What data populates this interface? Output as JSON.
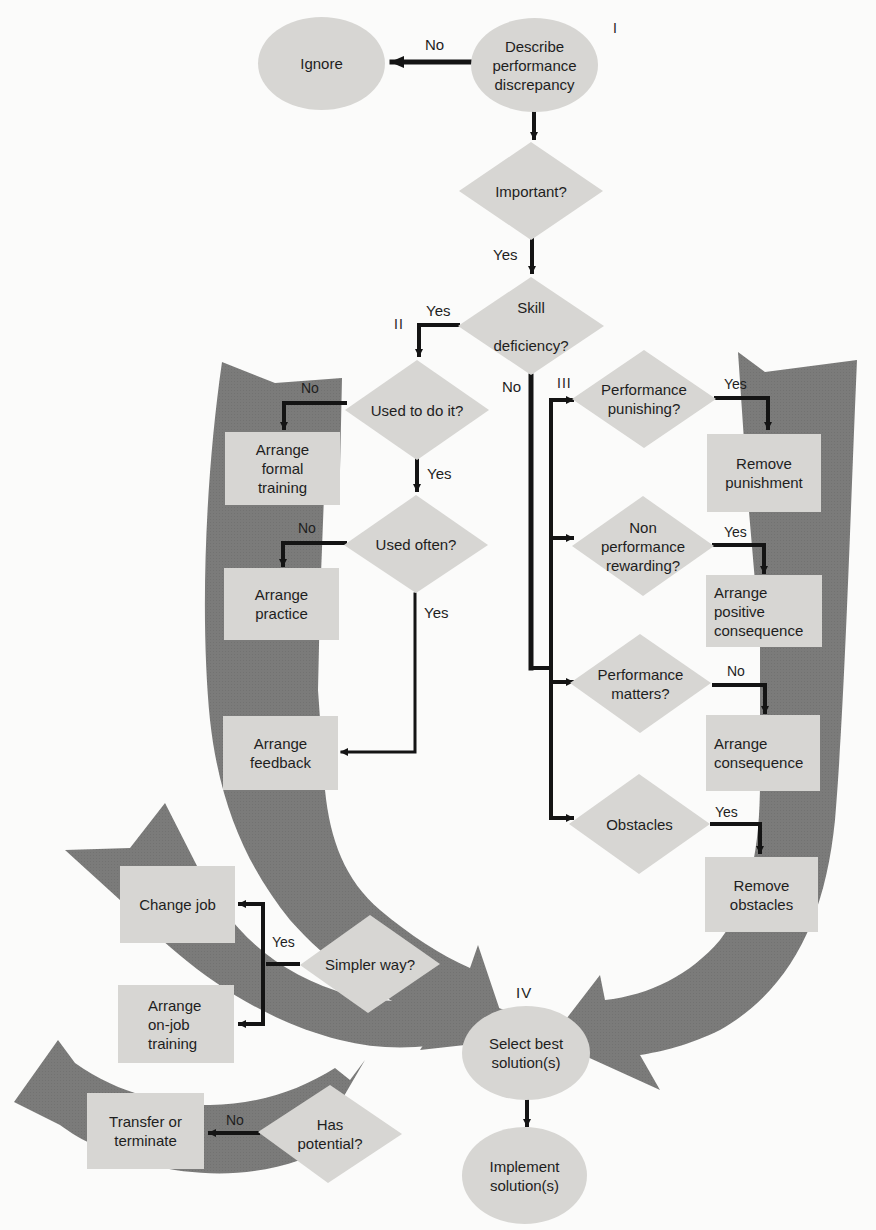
{
  "colors": {
    "background": "#fbfbfa",
    "node_fill": "#d7d6d3",
    "big_arrow_fill": "#7b7b7a",
    "connector": "#141414",
    "text": "#1e1e1e"
  },
  "stage_labels": {
    "I": "I",
    "II": "II",
    "III": "III",
    "IV": "IV"
  },
  "nodes": {
    "ignore": "Ignore",
    "describe": "Describe\nperformance\ndiscrepancy",
    "important": "Important?",
    "skill_deficiency": "Skill\n\ndeficiency?",
    "used_to_do_it": "Used to do it?",
    "used_often": "Used often?",
    "arrange_formal_training": "Arrange\nformal\ntraining",
    "arrange_practice": "Arrange\npractice",
    "arrange_feedback": "Arrange\nfeedback",
    "performance_punishing": "Performance\npunishing?",
    "non_performance_rewarding": "Non\nperformance\nrewarding?",
    "performance_matters": "Performance\nmatters?",
    "obstacles": "Obstacles",
    "remove_punishment": "Remove\npunishment",
    "arrange_positive_consequence": "Arrange\npositive\nconsequence",
    "arrange_consequence": "Arrange\nconsequence",
    "remove_obstacles": "Remove\nobstacles",
    "change_job": "Change job",
    "arrange_on_job_training": "Arrange\non-job\ntraining",
    "simpler_way": "Simpler way?",
    "transfer_or_terminate": "Transfer or\nterminate",
    "has_potential": "Has\npotential?",
    "select_best_solutions": "Select best\nsolution(s)",
    "implement_solutions": "Implement\nsolution(s)"
  },
  "edge_labels": {
    "describe_to_ignore": "No",
    "important_yes": "Yes",
    "skill_yes": "Yes",
    "skill_no": "No",
    "used_to_do_no": "No",
    "used_to_do_yes": "Yes",
    "used_often_no": "No",
    "used_often_yes": "Yes",
    "punishing_yes": "Yes",
    "rewarding_yes": "Yes",
    "matters_no": "No",
    "obstacles_yes": "Yes",
    "simpler_yes": "Yes",
    "potential_no": "No"
  }
}
